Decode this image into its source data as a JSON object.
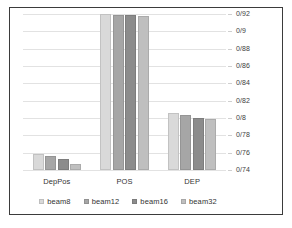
{
  "title_remnant": "",
  "chart_data": {
    "type": "bar",
    "title": "",
    "subtitle": "",
    "xlabel": "",
    "ylabel": "",
    "grid": true,
    "legend_position": "bottom",
    "decimal_separator": "/",
    "categories": [
      "DepPos",
      "POS",
      "DEP"
    ],
    "ylim": [
      0.74,
      0.92
    ],
    "ytick_values": [
      0.92,
      0.9,
      0.88,
      0.86,
      0.84,
      0.82,
      0.8,
      0.78,
      0.76,
      0.74
    ],
    "ytick_labels": [
      "0/92",
      "0/9",
      "0/88",
      "0/86",
      "0/84",
      "0/82",
      "0/8",
      "0/78",
      "0/76",
      "0/74"
    ],
    "series": [
      {
        "name": "beam8",
        "color": "#d9d9d9",
        "values": [
          0.7585,
          0.9195,
          0.8055
        ]
      },
      {
        "name": "beam12",
        "color": "#a6a6a6",
        "values": [
          0.7565,
          0.9185,
          0.8035
        ]
      },
      {
        "name": "beam16",
        "color": "#8c8c8c",
        "values": [
          0.7525,
          0.919,
          0.8
        ]
      },
      {
        "name": "beam32",
        "color": "#bfbfbf",
        "values": [
          0.7465,
          0.9175,
          0.7985
        ]
      }
    ]
  },
  "colors": {
    "frame_border": "#3b3b3b",
    "gridline": "#e2e2e2",
    "axis_text": "#3d3d3d",
    "label_text": "#333333",
    "background": "#ffffff"
  }
}
